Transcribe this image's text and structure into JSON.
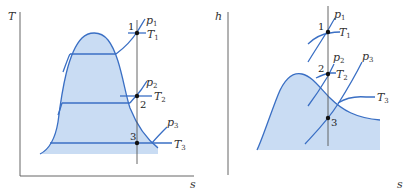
{
  "diagrams": [
    {
      "id": "T-s",
      "y_axis_label": "T",
      "x_axis_label": "s",
      "states": [
        {
          "label": "1",
          "temperature": "T",
          "temperature_sub": "1",
          "pressure": "p",
          "pressure_sub": "1"
        },
        {
          "label": "2",
          "temperature": "T",
          "temperature_sub": "2",
          "pressure": "p",
          "pressure_sub": "2"
        },
        {
          "label": "3",
          "temperature": "T",
          "temperature_sub": "3",
          "pressure": "p",
          "pressure_sub": "3"
        }
      ]
    },
    {
      "id": "h-s",
      "y_axis_label": "h",
      "x_axis_label": "s",
      "states": [
        {
          "label": "1",
          "temperature": "T",
          "temperature_sub": "1",
          "pressure": "p",
          "pressure_sub": "1"
        },
        {
          "label": "2",
          "temperature": "T",
          "temperature_sub": "2",
          "pressure": "p",
          "pressure_sub": "2"
        },
        {
          "label": "3",
          "temperature": "T",
          "temperature_sub": "3",
          "pressure": "p",
          "pressure_sub": "3"
        }
      ]
    }
  ],
  "colors": {
    "curve": "#3a6fc4",
    "fill": "#c9dcf3",
    "axis": "#555555",
    "point": "#111111"
  }
}
